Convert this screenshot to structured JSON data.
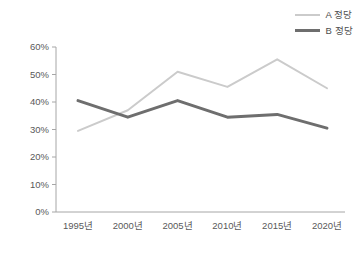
{
  "chart_data": {
    "type": "line",
    "title": "",
    "xlabel": "",
    "ylabel": "",
    "categories": [
      "1995년",
      "2000년",
      "2005년",
      "2010년",
      "2015년",
      "2020년"
    ],
    "series": [
      {
        "name": "A 정당",
        "color": "#cbcbcb",
        "width": 2,
        "values": [
          29.5,
          37.0,
          51.0,
          45.5,
          55.5,
          45.0
        ]
      },
      {
        "name": "B 정당",
        "color": "#6e6e6e",
        "width": 3,
        "values": [
          40.5,
          34.5,
          40.5,
          34.5,
          35.5,
          30.5
        ]
      }
    ],
    "ylim": [
      0,
      60
    ],
    "ytick_values": [
      0,
      10,
      20,
      30,
      40,
      50,
      60
    ],
    "ytick_labels": [
      "0%",
      "10%",
      "20%",
      "30%",
      "40%",
      "50%",
      "60%"
    ],
    "grid": false,
    "legend_position": "top-right",
    "axis_color": "#a6a6a6",
    "background": "#ffffff"
  },
  "legend": {
    "items": [
      {
        "label": "A 정당"
      },
      {
        "label": "B 정당"
      }
    ]
  },
  "axes": {
    "y_labels": [
      "60%",
      "50%",
      "40%",
      "30%",
      "20%",
      "10%",
      "0%"
    ],
    "x_labels": [
      "1995년",
      "2000년",
      "2005년",
      "2010년",
      "2015년",
      "2020년"
    ]
  }
}
